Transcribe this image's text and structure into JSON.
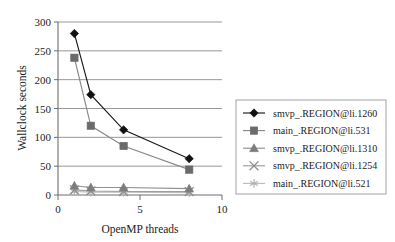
{
  "chart_data": {
    "type": "line",
    "title": "",
    "subtitle": "",
    "xlabel": "OpenMP threads",
    "ylabel": "Wallclock seconds",
    "x": [
      1,
      2,
      4,
      8
    ],
    "xlim": [
      0,
      10
    ],
    "ylim": [
      0,
      300
    ],
    "xticks": [
      0,
      5,
      10
    ],
    "xtick_labels": [
      "0",
      "5",
      "10"
    ],
    "yticks": [
      0,
      50,
      100,
      150,
      200,
      250,
      300
    ],
    "ytick_labels": [
      "0",
      "50",
      "100",
      "150",
      "200",
      "250",
      "300"
    ],
    "grid": "horizontal",
    "legend_position": "right",
    "series": [
      {
        "name": "smvp_.REGION@li.1260",
        "marker": "diamond",
        "color": "#111111",
        "line_color": "#1a1a1a",
        "values": [
          280,
          174,
          113,
          63
        ]
      },
      {
        "name": "main_.REGION@li.531",
        "marker": "square",
        "color": "#6b6b6b",
        "line_color": "#8a8a8a",
        "values": [
          238,
          120,
          85,
          44
        ]
      },
      {
        "name": "smvp_.REGION@li.1310",
        "marker": "triangle",
        "color": "#7d7d7d",
        "line_color": "#909090",
        "values": [
          16,
          13,
          13,
          11
        ]
      },
      {
        "name": "smvp_.REGION@li.1254",
        "marker": "x",
        "color": "#8f8f8f",
        "line_color": "#9d9d9d",
        "values": [
          9,
          7,
          6,
          6
        ]
      },
      {
        "name": "main_.REGION@li.521",
        "marker": "star",
        "color": "#b0b0b0",
        "line_color": "#bdbdbd",
        "values": [
          6,
          5,
          5,
          4
        ]
      }
    ]
  },
  "axes": {
    "y_title": "Wallclock seconds",
    "x_title": "OpenMP threads",
    "y_ticks": [
      "300",
      "250",
      "200",
      "150",
      "100",
      "50",
      "0"
    ],
    "x_ticks": [
      "0",
      "5",
      "10"
    ]
  },
  "legend": {
    "entries": [
      {
        "label": "smvp_.REGION@li.1260"
      },
      {
        "label": "main_.REGION@li.531"
      },
      {
        "label": "smvp_.REGION@li.1310"
      },
      {
        "label": "smvp_.REGION@li.1254"
      },
      {
        "label": "main_.REGION@li.521"
      }
    ]
  }
}
